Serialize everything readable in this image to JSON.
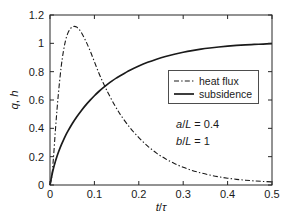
{
  "chart_data": {
    "type": "line",
    "title": "",
    "xlabel": "t/τ",
    "ylabel": "q, h",
    "xlim": [
      0,
      0.5
    ],
    "ylim": [
      0,
      1.2
    ],
    "xticks": [
      0,
      0.1,
      0.2,
      0.3,
      0.4,
      0.5
    ],
    "xtick_labels": [
      "0",
      "0.1",
      "0.2",
      "0.3",
      "0.4",
      "0.5"
    ],
    "yticks": [
      0,
      0.2,
      0.4,
      0.6,
      0.8,
      1,
      1.2
    ],
    "ytick_labels": [
      "0",
      "0.2",
      "0.4",
      "0.6",
      "0.8",
      "1",
      "1.2"
    ],
    "grid": false,
    "legend_position": "center-right",
    "series": [
      {
        "name": "heat flux",
        "style": "dash-dot",
        "color": "#1a1a1a",
        "x": [
          0,
          0.004,
          0.008,
          0.012,
          0.016,
          0.02,
          0.025,
          0.03,
          0.035,
          0.04,
          0.045,
          0.05,
          0.055,
          0.06,
          0.065,
          0.07,
          0.08,
          0.09,
          0.1,
          0.11,
          0.12,
          0.13,
          0.14,
          0.15,
          0.16,
          0.18,
          0.2,
          0.22,
          0.24,
          0.26,
          0.28,
          0.3,
          0.32,
          0.34,
          0.36,
          0.38,
          0.4,
          0.42,
          0.44,
          0.46,
          0.48,
          0.5
        ],
        "y": [
          0,
          0.06,
          0.2,
          0.38,
          0.54,
          0.68,
          0.83,
          0.94,
          1.02,
          1.07,
          1.1,
          1.115,
          1.12,
          1.115,
          1.1,
          1.08,
          1.02,
          0.95,
          0.87,
          0.79,
          0.72,
          0.655,
          0.595,
          0.54,
          0.49,
          0.405,
          0.335,
          0.275,
          0.225,
          0.185,
          0.152,
          0.125,
          0.103,
          0.085,
          0.07,
          0.058,
          0.048,
          0.04,
          0.034,
          0.029,
          0.025,
          0.022
        ]
      },
      {
        "name": "subsidence",
        "style": "solid",
        "color": "#1a1a1a",
        "x": [
          0,
          0.004,
          0.008,
          0.012,
          0.016,
          0.02,
          0.025,
          0.03,
          0.035,
          0.04,
          0.05,
          0.06,
          0.07,
          0.08,
          0.09,
          0.1,
          0.11,
          0.12,
          0.13,
          0.14,
          0.15,
          0.16,
          0.18,
          0.2,
          0.22,
          0.24,
          0.26,
          0.28,
          0.3,
          0.32,
          0.34,
          0.36,
          0.38,
          0.4,
          0.42,
          0.44,
          0.46,
          0.48,
          0.5
        ],
        "y": [
          0,
          0.065,
          0.12,
          0.165,
          0.205,
          0.24,
          0.28,
          0.315,
          0.348,
          0.378,
          0.432,
          0.48,
          0.523,
          0.562,
          0.597,
          0.63,
          0.66,
          0.687,
          0.712,
          0.735,
          0.756,
          0.775,
          0.81,
          0.84,
          0.866,
          0.888,
          0.907,
          0.923,
          0.937,
          0.949,
          0.959,
          0.967,
          0.974,
          0.98,
          0.985,
          0.989,
          0.992,
          0.995,
          0.998
        ]
      }
    ],
    "annotations": [
      {
        "text_italic_1": "a",
        "text_rest_1": "/",
        "text_italic_2": "L",
        "text_rest_2": " = 0.4",
        "full": "a/L = 0.4"
      },
      {
        "text_italic_1": "b",
        "text_rest_1": "/",
        "text_italic_2": "L",
        "text_rest_2": " = 1",
        "full": "b/L = 1"
      }
    ]
  },
  "axis": {
    "ylabel_part_italic": "q",
    "ylabel_part_rest": ", ",
    "ylabel_part_italic2": "h",
    "xlabel_part_italic": "t",
    "xlabel_part_sep": "/",
    "xlabel_part_tau": "τ"
  },
  "legend": {
    "entries": [
      {
        "label": "heat flux"
      },
      {
        "label": "subsidence"
      }
    ]
  },
  "annotations": {
    "line1_a": "a",
    "line1_slash": "/",
    "line1_L": "L",
    "line1_val": " = 0.4",
    "line2_b": "b",
    "line2_slash": "/",
    "line2_L": "L",
    "line2_val": " = 1"
  },
  "ticks": {
    "x": [
      "0",
      "0.1",
      "0.2",
      "0.3",
      "0.4",
      "0.5"
    ],
    "y": [
      "0",
      "0.2",
      "0.4",
      "0.6",
      "0.8",
      "1",
      "1.2"
    ]
  }
}
